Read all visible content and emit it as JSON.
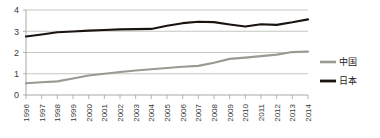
{
  "chart_data": {
    "type": "line",
    "title": "",
    "xlabel": "",
    "ylabel": "",
    "ylim": [
      0,
      4
    ],
    "yticks": [
      0,
      1,
      2,
      3,
      4
    ],
    "grid": true,
    "legend_position": "right",
    "categories": [
      "1996",
      "1997",
      "1998",
      "1999",
      "2000",
      "2001",
      "2002",
      "2003",
      "2004",
      "2005",
      "2006",
      "2007",
      "2008",
      "2009",
      "2010",
      "2011",
      "2012",
      "2013",
      "2014"
    ],
    "series": [
      {
        "name": "中国",
        "color": "#9a9a92",
        "values": [
          0.55,
          0.6,
          0.64,
          0.78,
          0.92,
          1.0,
          1.08,
          1.15,
          1.21,
          1.27,
          1.33,
          1.37,
          1.52,
          1.7,
          1.76,
          1.83,
          1.9,
          2.02,
          2.05
        ]
      },
      {
        "name": "日本",
        "color": "#1a1410",
        "values": [
          2.75,
          2.85,
          2.95,
          2.99,
          3.03,
          3.06,
          3.09,
          3.1,
          3.11,
          3.26,
          3.38,
          3.45,
          3.43,
          3.32,
          3.22,
          3.33,
          3.3,
          3.42,
          3.56
        ]
      }
    ]
  },
  "legend": {
    "items": [
      {
        "label": "中国",
        "color": "#9a9a92"
      },
      {
        "label": "日本",
        "color": "#1a1410"
      }
    ]
  },
  "axes": {
    "y_tick_labels": [
      "0",
      "1",
      "2",
      "3",
      "4"
    ],
    "x_tick_labels": [
      "1996",
      "1997",
      "1998",
      "1999",
      "2000",
      "2001",
      "2002",
      "2003",
      "2004",
      "2005",
      "2006",
      "2007",
      "2008",
      "2009",
      "2010",
      "2011",
      "2012",
      "2013",
      "2014"
    ]
  }
}
